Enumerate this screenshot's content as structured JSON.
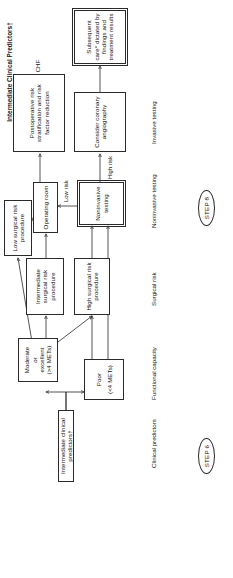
{
  "figure": {
    "type": "clinical-algorithm-flowchart",
    "orientation": "rotated-90-ccw"
  },
  "header_panel": {
    "title": "Intermediate Clinical Predictors†",
    "bullets": [
      "Mild angina pectoris",
      "Prior MI",
      "Compensated or prior CHF",
      "Diabetes mellitus"
    ]
  },
  "row_labels": [
    {
      "label": "Clinical predictors"
    },
    {
      "label": "Functional capacity"
    },
    {
      "label": "Surgical risk"
    },
    {
      "label": "Noninvasive testing"
    },
    {
      "label": "Invasive testing"
    }
  ],
  "steps": [
    {
      "label": "STEP 6"
    },
    {
      "label": "STEP 8"
    }
  ],
  "nodes": {
    "intermediate_predictors": "Intermediate clinical predictors†",
    "poor": "Poor\n(<4 METs)",
    "poor_line1": "Poor",
    "poor_line2": "(<4 METs)",
    "moderate_line1": "Moderate",
    "moderate_line2": "or",
    "moderate_line3": "excellent",
    "moderate_line4": "(>4 METs)",
    "high_surgical_risk": "High surgical risk procedure",
    "intermediate_surgical_risk": "Intermediate surgical risk procedure",
    "low_surgical_risk": "Low surgical risk procedure",
    "operating_room": "Operating room",
    "noninvasive_testing": "Noninvasive testing",
    "consider_angiography": "Consider coronary angiography",
    "postoperative": "Postoperative risk stratification and risk factor reduction",
    "subsequent_care": "Subsequent care* dictated by findings and treatment results"
  },
  "edge_labels": {
    "low_risk": "Low risk",
    "high_risk": "High risk"
  },
  "colors": {
    "ink": "#2a2a2a",
    "background": "#ffffff"
  }
}
